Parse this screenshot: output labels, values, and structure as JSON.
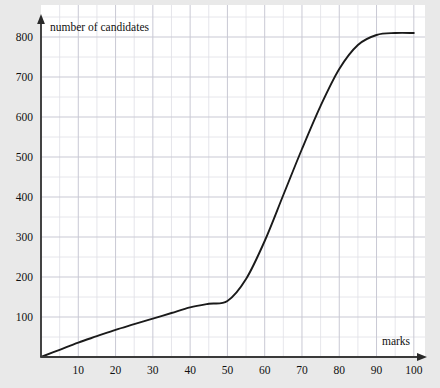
{
  "figure": {
    "background_color": "#e9e9e9",
    "plot_background_color": "#ffffff",
    "grid_minor_color": "#e0e0e6",
    "grid_major_color": "#c9c9d4",
    "axis_color": "#3a3a3a",
    "curve_color": "#1a1a1a"
  },
  "chart_data": {
    "type": "line",
    "title": "",
    "subtitle": "",
    "xlabel": "marks",
    "ylabel": "number of candidates",
    "ylabel_position": "above-axis-top",
    "xlabel_position": "right-of-axis-end",
    "grid": true,
    "grid_major_step_x": 10,
    "grid_major_step_y": 100,
    "grid_minor_step_x": 5,
    "grid_minor_step_y": 50,
    "legend": "none",
    "xlim": [
      0,
      103
    ],
    "ylim": [
      0,
      880
    ],
    "xticks": [
      10,
      20,
      30,
      40,
      50,
      60,
      70,
      80,
      90,
      100
    ],
    "xtick_labels": [
      "10",
      "20",
      "30",
      "40",
      "50",
      "60",
      "70",
      "80",
      "90",
      "100"
    ],
    "yticks": [
      100,
      200,
      300,
      400,
      500,
      600,
      700,
      800
    ],
    "ytick_labels": [
      "100",
      "200",
      "300",
      "400",
      "500",
      "600",
      "700",
      "800"
    ],
    "series": [
      {
        "name": "cumulative frequency",
        "x": [
          0,
          5,
          10,
          15,
          20,
          25,
          30,
          35,
          40,
          45,
          50,
          55,
          60,
          65,
          70,
          75,
          80,
          85,
          90,
          95,
          100
        ],
        "values": [
          0,
          18,
          36,
          52,
          68,
          82,
          96,
          110,
          124,
          133,
          140,
          195,
          290,
          405,
          520,
          628,
          720,
          780,
          805,
          810,
          810
        ]
      }
    ],
    "annotations": []
  },
  "axes": {
    "y_arrow": "arrow-up",
    "x_arrow": "arrow-right"
  }
}
